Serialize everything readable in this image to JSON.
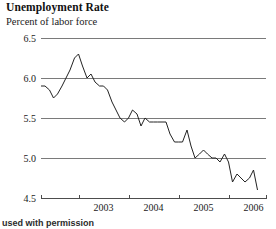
{
  "figure": {
    "title": "Unemployment Rate",
    "subtitle": "Percent of labor force",
    "caption": "used with permission"
  },
  "chart_data": {
    "type": "line",
    "title": "Unemployment Rate",
    "subtitle": "Percent of labor force",
    "xlabel": "",
    "ylabel": "Percent of labor force",
    "ylim": [
      4.5,
      6.5
    ],
    "ytick_values": [
      6.5,
      6.0,
      5.5,
      5.0,
      4.5
    ],
    "ytick_labels": [
      "6.5",
      "6.0",
      "5.5",
      "5.0",
      "4.5"
    ],
    "xtick_labels": [
      "2003",
      "2004",
      "2005",
      "2006"
    ],
    "xlim": [
      2002.25,
      2006.75
    ],
    "xtick_values": [
      2003.0,
      2004.0,
      2005.0,
      2006.0
    ],
    "grid": true,
    "grid_axis": "y",
    "legend": null,
    "series": [
      {
        "name": "Unemployment Rate",
        "color": "#222222",
        "x": [
          2002.25,
          2002.33,
          2002.42,
          2002.5,
          2002.58,
          2002.67,
          2002.75,
          2002.83,
          2002.92,
          2003.0,
          2003.08,
          2003.17,
          2003.25,
          2003.33,
          2003.42,
          2003.5,
          2003.58,
          2003.67,
          2003.75,
          2003.83,
          2003.92,
          2004.0,
          2004.08,
          2004.17,
          2004.25,
          2004.33,
          2004.42,
          2004.5,
          2004.58,
          2004.67,
          2004.75,
          2004.83,
          2004.92,
          2005.0,
          2005.08,
          2005.17,
          2005.25,
          2005.33,
          2005.42,
          2005.5,
          2005.58,
          2005.67,
          2005.75,
          2005.83,
          2005.92,
          2006.0,
          2006.08,
          2006.17,
          2006.25,
          2006.33,
          2006.42,
          2006.5,
          2006.58
        ],
        "y": [
          5.9,
          5.9,
          5.85,
          5.75,
          5.8,
          5.9,
          6.0,
          6.1,
          6.25,
          6.3,
          6.15,
          6.0,
          6.05,
          5.95,
          5.9,
          5.9,
          5.85,
          5.7,
          5.6,
          5.5,
          5.45,
          5.5,
          5.6,
          5.55,
          5.4,
          5.5,
          5.45,
          5.45,
          5.45,
          5.45,
          5.45,
          5.3,
          5.2,
          5.2,
          5.2,
          5.35,
          5.15,
          5.0,
          5.05,
          5.1,
          5.05,
          5.0,
          5.0,
          4.95,
          5.05,
          4.95,
          4.7,
          4.8,
          4.75,
          4.7,
          4.75,
          4.85,
          4.6
        ]
      }
    ]
  },
  "axes_geometry": {
    "plot_left": 41,
    "plot_right": 266,
    "plot_top": 38,
    "plot_bottom": 198
  },
  "icons": {}
}
